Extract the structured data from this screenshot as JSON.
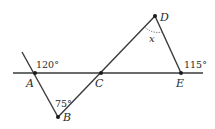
{
  "diagram": {
    "points": {
      "A": {
        "label": "A"
      },
      "B": {
        "label": "B"
      },
      "C": {
        "label": "C"
      },
      "D": {
        "label": "D"
      },
      "E": {
        "label": "E"
      }
    },
    "angles": {
      "at_A": "120°",
      "at_B": "75°",
      "at_D": "x",
      "at_E": "115°"
    }
  }
}
